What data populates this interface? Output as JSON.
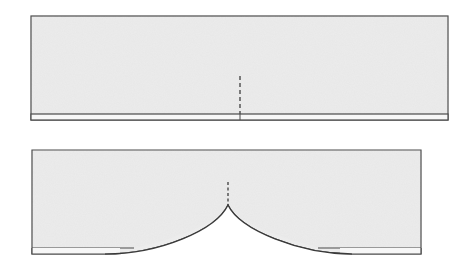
{
  "diagram": {
    "colors": {
      "background": "#ffffff",
      "fill": "#ececec",
      "stroke": "#4a4a4a",
      "hem_fill": "#f7f7f7"
    },
    "panels": [
      {
        "id": "flat-panel",
        "rect": {
          "x": 31,
          "y": 16,
          "w": 417,
          "h": 104
        },
        "hem_y": 114,
        "center_x": 240,
        "dash": {
          "y1": 76,
          "y2": 114
        }
      },
      {
        "id": "curved-panel",
        "rect": {
          "x": 32,
          "y": 150,
          "w": 389,
          "h": 104
        },
        "hem_y": 248,
        "center_x": 228,
        "cusp_y": 205,
        "dash": {
          "y1": 182,
          "y2": 205
        }
      }
    ]
  }
}
